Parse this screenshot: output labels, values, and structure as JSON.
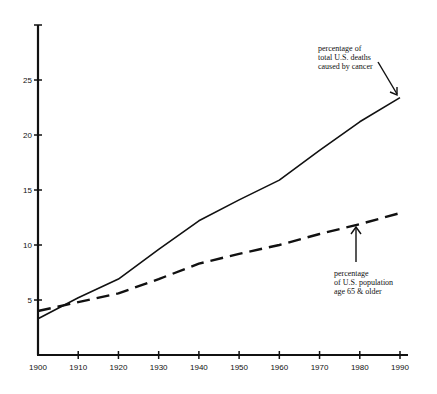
{
  "chart_data": {
    "type": "line",
    "title": "",
    "xlabel": "",
    "ylabel": "",
    "x": [
      1900,
      1910,
      1920,
      1930,
      1940,
      1950,
      1960,
      1970,
      1980,
      1990
    ],
    "xticks": [
      "1900",
      "1910",
      "1920",
      "1930",
      "1940",
      "1950",
      "1960",
      "1970",
      "1980",
      "1990"
    ],
    "yticks": [
      "5",
      "10",
      "15",
      "20",
      "25"
    ],
    "ylim": [
      0,
      30
    ],
    "xlim": [
      1900,
      1990
    ],
    "grid": false,
    "series": [
      {
        "name": "percentage of total U.S. deaths caused by cancer",
        "style": "solid",
        "values": [
          3.3,
          5.2,
          6.9,
          9.6,
          12.2,
          14.1,
          15.9,
          18.6,
          21.2,
          23.4
        ]
      },
      {
        "name": "percentage of U.S. population age 65 & older",
        "style": "dashed",
        "values": [
          4.0,
          4.8,
          5.6,
          6.9,
          8.3,
          9.2,
          10.0,
          11.0,
          11.9,
          12.9
        ]
      }
    ],
    "annotations": [
      {
        "series": 0,
        "lines": [
          "percentage of",
          "total U.S. deaths",
          "caused by cancer"
        ],
        "arrow_to_x": 1990
      },
      {
        "series": 1,
        "lines": [
          "percentage",
          "of U.S. population",
          "age 65 & older"
        ],
        "arrow_to_x": 1980
      }
    ],
    "legend": "none (inline annotations with arrows)"
  }
}
